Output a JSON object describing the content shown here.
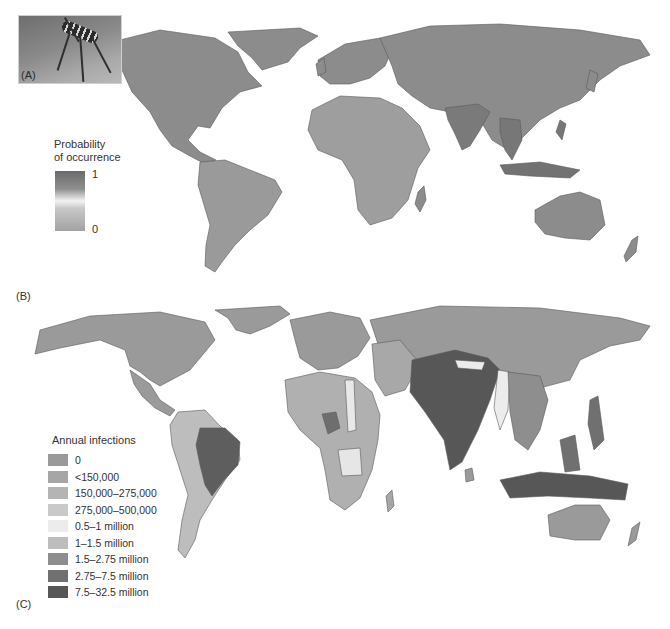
{
  "figure": {
    "panels": [
      {
        "id": "A",
        "label": "(A)",
        "content": "mosquito-photo"
      },
      {
        "id": "B",
        "label": "(B)",
        "content": "probability-of-occurrence-world-map"
      },
      {
        "id": "C",
        "label": "(C)",
        "content": "annual-infections-cartogram"
      }
    ]
  },
  "panel_a": {
    "label": "(A)"
  },
  "panel_b": {
    "label": "(B)",
    "legend": {
      "title_line1": "Probability",
      "title_line2": "of occurrence",
      "max_label": "1",
      "min_label": "0",
      "ramp_colors": [
        "#6a6a6a",
        "#8f8f8f",
        "#f3f3f3",
        "#c8c8c8",
        "#a2a2a2"
      ]
    },
    "land_color": "#8c8c8c",
    "high_probability_regions": [
      "Amazon basin",
      "Central Africa",
      "India",
      "Southeast Asia",
      "Indonesia"
    ]
  },
  "panel_c": {
    "label": "(C)",
    "legend": {
      "title": "Annual infections",
      "classes": [
        {
          "label": "0",
          "color": "#9a9a9a"
        },
        {
          "label": "<150,000",
          "color": "#a6a6a6"
        },
        {
          "label": "150,000–275,000",
          "color": "#b4b4b4"
        },
        {
          "label": "275,000–500,000",
          "color": "#c9c9c9"
        },
        {
          "label": "0.5–1 million",
          "color": "#ececec"
        },
        {
          "label": "1–1.5 million",
          "color": "#bdbdbd"
        },
        {
          "label": "1.5–2.75 million",
          "color": "#8e8e8e"
        },
        {
          "label": "2.75–7.5 million",
          "color": "#707070"
        },
        {
          "label": "7.5–32.5 million",
          "color": "#575757"
        }
      ]
    },
    "highlighted_regions": [
      {
        "region": "India",
        "class": "7.5–32.5 million"
      },
      {
        "region": "Indonesia",
        "class": "7.5–32.5 million"
      },
      {
        "region": "Brazil",
        "class": "2.75–7.5 million"
      },
      {
        "region": "Nigeria",
        "class": "2.75–7.5 million"
      },
      {
        "region": "Myanmar",
        "class": "0.5–1 million"
      }
    ]
  }
}
